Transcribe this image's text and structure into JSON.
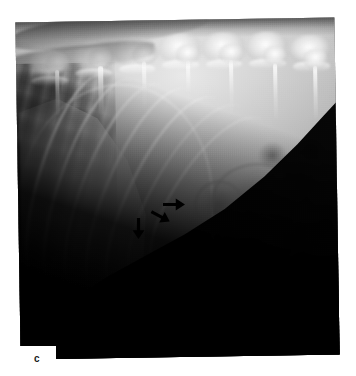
{
  "figure": {
    "panel_letter": "c",
    "modality": "radiograph",
    "view": "lateral abdomen",
    "background_color": "#ffffff",
    "film_black": "#000000",
    "annotation_color": "#000000"
  },
  "xray": {
    "frame": {
      "left": 18,
      "top": 20,
      "width": 319,
      "height": 337,
      "rotation_deg": -0.9
    },
    "regions": [
      {
        "name": "lumbar-spine",
        "label": "lumbar vertebrae"
      },
      {
        "name": "rib-cage",
        "label": "caudal ribs"
      },
      {
        "name": "liver",
        "label": "liver / diaphragm"
      },
      {
        "name": "bowel-loops",
        "label": "small intestine"
      },
      {
        "name": "mass",
        "label": "soft tissue mass"
      },
      {
        "name": "collimation",
        "label": "collimated background"
      }
    ],
    "vertebrae": [
      {
        "x": 6,
        "y": 10,
        "w": 13,
        "h": 9
      },
      {
        "x": 19,
        "y": 8,
        "w": 13,
        "h": 9
      },
      {
        "x": 32,
        "y": 7,
        "w": 13,
        "h": 9
      },
      {
        "x": 45,
        "y": 6,
        "w": 13,
        "h": 9
      },
      {
        "x": 58,
        "y": 6,
        "w": 13,
        "h": 9
      },
      {
        "x": 71,
        "y": 6,
        "w": 13,
        "h": 9
      },
      {
        "x": 84,
        "y": 7,
        "w": 13,
        "h": 9
      }
    ],
    "spinous_processes": [
      {
        "x": 14,
        "y": 16,
        "h": 13
      },
      {
        "x": 27,
        "y": 15,
        "h": 14
      },
      {
        "x": 40,
        "y": 14,
        "h": 15
      },
      {
        "x": 53,
        "y": 14,
        "h": 15
      },
      {
        "x": 66,
        "y": 14,
        "h": 16
      },
      {
        "x": 79,
        "y": 15,
        "h": 16
      },
      {
        "x": 91,
        "y": 16,
        "h": 15
      }
    ],
    "ribs": [
      {
        "x": 8,
        "y": 16,
        "w": 20,
        "h": 62,
        "rot": 14
      },
      {
        "x": 14,
        "y": 17,
        "w": 21,
        "h": 64,
        "rot": 16
      },
      {
        "x": 21,
        "y": 18,
        "w": 22,
        "h": 64,
        "rot": 18
      },
      {
        "x": 28,
        "y": 19,
        "w": 22,
        "h": 64,
        "rot": 20
      },
      {
        "x": 35,
        "y": 21,
        "w": 22,
        "h": 62,
        "rot": 23
      },
      {
        "x": 42,
        "y": 23,
        "w": 22,
        "h": 58,
        "rot": 26
      },
      {
        "x": 49,
        "y": 26,
        "w": 21,
        "h": 52,
        "rot": 30
      }
    ],
    "bowel_loops": [
      {
        "x": 60,
        "y": 43,
        "w": 26,
        "h": 20
      },
      {
        "x": 70,
        "y": 50,
        "w": 20,
        "h": 18
      },
      {
        "x": 78,
        "y": 40,
        "w": 16,
        "h": 15
      },
      {
        "x": 84,
        "y": 52,
        "w": 15,
        "h": 16
      },
      {
        "x": 62,
        "y": 58,
        "w": 22,
        "h": 14
      },
      {
        "x": 88,
        "y": 44,
        "w": 13,
        "h": 13
      },
      {
        "x": 55,
        "y": 48,
        "w": 13,
        "h": 12
      }
    ],
    "bowel_blobs": [
      {
        "x": 74,
        "y": 37,
        "w": 9,
        "h": 8
      },
      {
        "x": 86,
        "y": 36,
        "w": 8,
        "h": 7
      },
      {
        "x": 67,
        "y": 62,
        "w": 10,
        "h": 7
      },
      {
        "x": 91,
        "y": 57,
        "w": 7,
        "h": 7
      },
      {
        "x": 80,
        "y": 61,
        "w": 9,
        "h": 6
      }
    ],
    "arrows": [
      {
        "name": "arrow-upper-right",
        "x": 163,
        "y": 198,
        "length": 22,
        "angle_deg": 180,
        "note": "points left at cranial margin of mass"
      },
      {
        "name": "arrow-middle",
        "x": 150,
        "y": 210,
        "length": 21,
        "angle_deg": 208,
        "note": "points left-up at caudoventral mass margin"
      },
      {
        "name": "arrow-lower-left",
        "x": 128,
        "y": 222,
        "length": 21,
        "angle_deg": 270,
        "note": "points up at ventral mass margin"
      }
    ]
  }
}
